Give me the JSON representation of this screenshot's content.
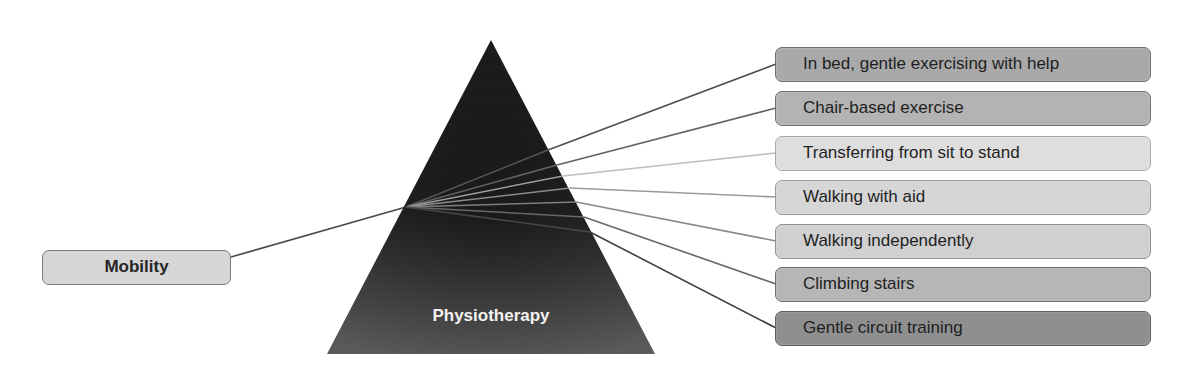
{
  "diagram": {
    "source": {
      "label": "Mobility",
      "fill": "#d6d6d6"
    },
    "prism": {
      "label": "Physiotherapy",
      "fill_top": "#1a1a1a",
      "fill_bottom": "#5a5a5a"
    },
    "outputs": [
      {
        "label": "In bed, gentle exercising with help",
        "fill": "#a9a9a9",
        "line_color": "#4f4f4f"
      },
      {
        "label": "Chair-based exercise",
        "fill": "#b3b3b3",
        "line_color": "#626262"
      },
      {
        "label": "Transferring from sit to stand",
        "fill": "#dedede",
        "line_color": "#bdbdbd"
      },
      {
        "label": "Walking with aid",
        "fill": "#d6d6d6",
        "line_color": "#9a9a9a"
      },
      {
        "label": "Walking independently",
        "fill": "#d0d0d0",
        "line_color": "#888888"
      },
      {
        "label": "Climbing stairs",
        "fill": "#b6b6b6",
        "line_color": "#666666"
      },
      {
        "label": "Gentle circuit training",
        "fill": "#8f8f8f",
        "line_color": "#3f3f3f"
      }
    ]
  }
}
